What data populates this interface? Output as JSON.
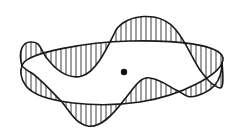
{
  "diagram": {
    "center_dot": {
      "cx": 124,
      "cy": 72,
      "r": 3.2
    },
    "colors": {
      "stroke": "#1a1a1a",
      "hatch": "#2a2a2a",
      "background": "#ffffff"
    }
  }
}
